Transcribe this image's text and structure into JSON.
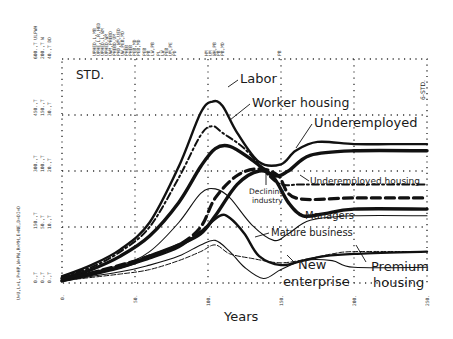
{
  "chart_data": {
    "type": "line",
    "title": "STD.",
    "corner_tag": "6-STD.",
    "xlabel": "Years",
    "ylabel": "",
    "x_ticks": [
      "0.",
      "50.",
      "100.",
      "150.",
      "200.",
      "250."
    ],
    "xlim": [
      0,
      250
    ],
    "y_axis_scale_columns": [
      [
        "0.,T",
        "150.,T",
        "300.,T",
        "450.,T",
        "600.,T"
      ],
      [
        "0.,T",
        "50.,T",
        "100.,T",
        "150.,T",
        "200.,T"
      ],
      [
        "0.,T",
        "10.,T",
        "20.,T",
        "30.,T",
        "40.,T"
      ]
    ],
    "y_axis_series_legend": "U=U,L=L,P=HP,W=PW,R=MH,E=NE,D=DI=D",
    "top_annotations": [
      "ULPWH",
      "W",
      "DD",
      "UPHED,L,MB",
      "UPHE,L,R,HED",
      "UPHED,L,WM",
      "UPHED,WM",
      "UWM,PHEBD",
      "PHEBD,UM",
      "PHD,WM,UED",
      "UW,PEB,MD",
      "PHEB",
      "PHEB",
      "PEB,MD",
      "PEB,MD",
      "PEB",
      "PB",
      "LW,PB",
      "PL",
      "LW",
      "PEB",
      "UM,PE",
      "PD",
      "HM",
      "UM",
      "WH,PB",
      "PB",
      "PB,MD",
      "PB"
    ],
    "grid": true,
    "series": [
      {
        "name": "Labor",
        "style": "thick-solid",
        "x": [
          0,
          20,
          40,
          60,
          80,
          95,
          103,
          110,
          120,
          135,
          150,
          160,
          175,
          200,
          225,
          250
        ],
        "y": [
          0.03,
          0.08,
          0.15,
          0.27,
          0.52,
          0.76,
          0.81,
          0.79,
          0.67,
          0.54,
          0.53,
          0.59,
          0.63,
          0.62,
          0.62,
          0.62
        ]
      },
      {
        "name": "Worker housing",
        "style": "dash-dot",
        "x": [
          0,
          20,
          40,
          60,
          80,
          95,
          103,
          110,
          125,
          140,
          150,
          165,
          200,
          250
        ],
        "y": [
          0.03,
          0.07,
          0.14,
          0.25,
          0.47,
          0.66,
          0.7,
          0.67,
          0.6,
          0.49,
          0.44,
          0.44,
          0.44,
          0.44
        ]
      },
      {
        "name": "Underemployed",
        "style": "extra-thick-solid",
        "x": [
          0,
          20,
          40,
          60,
          80,
          95,
          105,
          115,
          130,
          145,
          155,
          170,
          200,
          250
        ],
        "y": [
          0.02,
          0.06,
          0.12,
          0.21,
          0.36,
          0.52,
          0.6,
          0.61,
          0.55,
          0.48,
          0.5,
          0.57,
          0.59,
          0.59
        ]
      },
      {
        "name": "Underemployed housing",
        "style": "thick-dash",
        "x": [
          0,
          40,
          60,
          80,
          95,
          105,
          120,
          135,
          148,
          160,
          200,
          250
        ],
        "y": [
          0.01,
          0.08,
          0.12,
          0.17,
          0.25,
          0.38,
          0.48,
          0.51,
          0.48,
          0.38,
          0.38,
          0.38
        ]
      },
      {
        "name": "Declining industry",
        "style": "extra-thick-solid",
        "x": [
          0,
          40,
          60,
          80,
          95,
          105,
          120,
          135,
          145,
          155,
          165,
          180,
          200,
          250
        ],
        "y": [
          0.01,
          0.07,
          0.12,
          0.17,
          0.22,
          0.3,
          0.44,
          0.5,
          0.47,
          0.36,
          0.3,
          0.31,
          0.33,
          0.33
        ]
      },
      {
        "name": "Managers",
        "style": "thin-solid",
        "x": [
          0,
          40,
          60,
          80,
          95,
          105,
          115,
          130,
          145,
          155,
          170,
          200,
          250
        ],
        "y": [
          0.02,
          0.08,
          0.14,
          0.27,
          0.4,
          0.42,
          0.38,
          0.26,
          0.19,
          0.22,
          0.28,
          0.3,
          0.3
        ]
      },
      {
        "name": "Mature business",
        "style": "thick-solid",
        "x": [
          0,
          40,
          60,
          80,
          95,
          108,
          115,
          125,
          135,
          150,
          165,
          180,
          200,
          250
        ],
        "y": [
          0.02,
          0.07,
          0.11,
          0.16,
          0.23,
          0.3,
          0.29,
          0.22,
          0.12,
          0.08,
          0.1,
          0.12,
          0.13,
          0.14
        ]
      },
      {
        "name": "New enterprise",
        "style": "thin-solid",
        "x": [
          0,
          40,
          60,
          80,
          95,
          105,
          115,
          125,
          138,
          150,
          165,
          185,
          200,
          250
        ],
        "y": [
          0.01,
          0.05,
          0.08,
          0.12,
          0.17,
          0.19,
          0.14,
          0.07,
          0.02,
          0.06,
          0.1,
          0.1,
          0.07,
          0.07
        ]
      },
      {
        "name": "Premium housing",
        "style": "thin-tick",
        "x": [
          0,
          40,
          60,
          80,
          95,
          105,
          115,
          130,
          150,
          170,
          185,
          200,
          250
        ],
        "y": [
          0.01,
          0.04,
          0.06,
          0.1,
          0.14,
          0.17,
          0.13,
          0.11,
          0.09,
          0.11,
          0.13,
          0.14,
          0.14
        ]
      }
    ],
    "annotations": [
      {
        "text": "Labor",
        "points_to": "Labor"
      },
      {
        "text": "Worker housing",
        "points_to": "Worker housing"
      },
      {
        "text": "Underemployed",
        "points_to": "Underemployed"
      },
      {
        "text": "Underemployed housing",
        "points_to": "Underemployed housing"
      },
      {
        "text": "Declining industry",
        "points_to": "Declining industry"
      },
      {
        "text": "Managers",
        "points_to": "Managers"
      },
      {
        "text": "Mature business",
        "points_to": "Mature business"
      },
      {
        "text": "New enterprise",
        "points_to": "New enterprise"
      },
      {
        "text": "Premium housing",
        "points_to": "Premium housing"
      }
    ],
    "legend_position": "inline-annotations"
  },
  "labels": {
    "title": "STD.",
    "corner_tag": "6-STD.",
    "xlabel": "Years",
    "labor": "Labor",
    "worker_housing": "Worker housing",
    "underemployed": "Underemployed",
    "underemployed_housing": "Underemployed housing",
    "declining_1": "Declining",
    "declining_2": "industry",
    "managers": "Managers",
    "mature_business": "Mature business",
    "new_1": "New",
    "new_2": "enterprise",
    "premium_1": "Premium",
    "premium_2": "housing",
    "xt0": "0.",
    "xt1": "50.",
    "xt2": "100.",
    "xt3": "150.",
    "xt4": "200.",
    "xt5": "250.",
    "ycol1_0": "0.,T",
    "ycol1_1": "150.,T",
    "ycol1_2": "300.,T",
    "ycol1_3": "450.,T",
    "ycol1_4": "600.,T ULPWH",
    "ycol2_0": "0.,T",
    "ycol2_1": "50.,T",
    "ycol2_2": "100.,T",
    "ycol2_3": "150.,T",
    "ycol2_4": "200.,T W",
    "ycol3_0": "0.,T",
    "ycol3_1": "10.,T",
    "ycol3_2": "20.,T",
    "ycol3_3": "30.,T",
    "ycol3_4": "40.,T DD",
    "ylegend": "U=U,L=L,P=HP,W=PW,R=MH,E=NE,D=DI=D"
  }
}
